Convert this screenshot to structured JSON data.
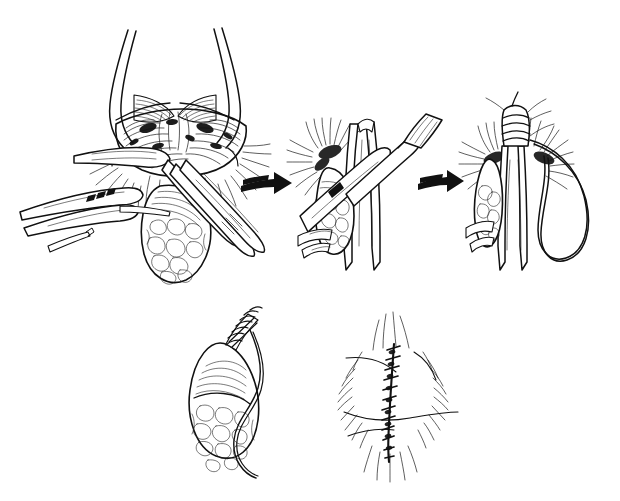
{
  "figure": {
    "title": "Operative technique sequence: inguinal hernia sac dissection, ligation, excision and wound closure",
    "medium": "pen-and-ink line drawing",
    "background_color": "#ffffff",
    "ink_color": "#111111",
    "width": 620,
    "height": 501,
    "has_text_labels": false,
    "label_text": ""
  },
  "panels": [
    {
      "id": "panel-1",
      "order": "1",
      "name": "exposure-and-dissection",
      "description": "Open inguinal wound held apart by retractors; hernia sac grasped with forceps and dissected free with scissors",
      "x": 10,
      "y": 18,
      "width": 250,
      "height": 260,
      "elements": [
        "retracted-skin-edges",
        "cremasteric-fibers",
        "hernia-sac",
        "sac-contents",
        "forceps-left",
        "forceps-lower-left",
        "dissecting-scissors",
        "toothed-forceps"
      ]
    },
    {
      "id": "panel-2",
      "order": "2",
      "name": "sac-isolation",
      "description": "Sac isolated on the cord; ribbon retractor and clamp elevate the neck of the sac",
      "x": 295,
      "y": 95,
      "width": 140,
      "height": 175,
      "elements": [
        "ribbon-retractor",
        "clamp",
        "spermatic-cord",
        "hernia-sac",
        "cut-fascial-edges"
      ]
    },
    {
      "id": "panel-3",
      "order": "3",
      "name": "neck-ligation",
      "description": "Neck of the sac transfixed and ligated; free suture loop left long",
      "x": 460,
      "y": 100,
      "width": 150,
      "height": 170,
      "elements": [
        "ligated-sac-neck",
        "transfixion-suture",
        "suture-loop",
        "spermatic-cord",
        "cut-fascial-edges"
      ]
    },
    {
      "id": "panel-4",
      "order": "4",
      "name": "excised-specimen",
      "description": "Excised hernia sac specimen with over-sewn whipstitched neck and trailing suture strand",
      "x": 175,
      "y": 305,
      "width": 130,
      "height": 175,
      "elements": [
        "specimen-sac",
        "specimen-contents",
        "whipstitch-neck",
        "trailing-suture"
      ]
    },
    {
      "id": "panel-5",
      "order": "5",
      "name": "wound-closure",
      "description": "Completed vertical skin closure with interrupted sutures and surrounding hair-bearing skin",
      "x": 335,
      "y": 312,
      "width": 135,
      "height": 170,
      "elements": [
        "closed-incision",
        "suture-line",
        "skin-folds",
        "hair-marks"
      ]
    }
  ],
  "arrows": [
    {
      "id": "arrow-1",
      "name": "arrow-panel1-to-panel2",
      "from_panel": "panel-1",
      "to_panel": "panel-2",
      "direction": "right",
      "x": 240,
      "y": 183,
      "length": 52,
      "color": "#111111"
    },
    {
      "id": "arrow-2",
      "name": "arrow-panel2-to-panel3",
      "from_panel": "panel-2",
      "to_panel": "panel-3",
      "direction": "right",
      "x": 418,
      "y": 180,
      "length": 44,
      "color": "#111111"
    }
  ]
}
